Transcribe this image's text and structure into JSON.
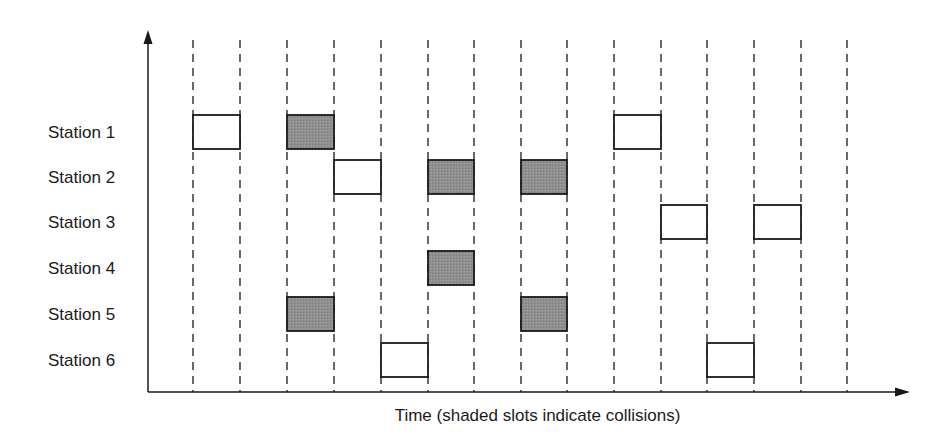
{
  "diagram": {
    "x_axis_caption": "Time (shaded slots indicate collisions)",
    "colors": {
      "line": "#1a1a1a",
      "dash": "#444444",
      "collision_fill": "#8f8f8f",
      "frame_fill": "#ffffff"
    },
    "slot_boundaries_x": [
      193,
      240,
      287,
      334,
      381,
      428,
      474,
      521,
      567,
      614,
      661,
      707,
      754,
      801,
      847
    ],
    "slot_count": 14,
    "stations": [
      {
        "label": "Station 1",
        "frames": [
          {
            "slot": 0,
            "collision": false
          },
          {
            "slot": 2,
            "collision": true
          },
          {
            "slot": 9,
            "collision": false
          }
        ]
      },
      {
        "label": "Station 2",
        "frames": [
          {
            "slot": 3,
            "collision": false
          },
          {
            "slot": 5,
            "collision": true
          },
          {
            "slot": 7,
            "collision": true
          }
        ]
      },
      {
        "label": "Station 3",
        "frames": [
          {
            "slot": 10,
            "collision": false
          },
          {
            "slot": 12,
            "collision": false
          }
        ]
      },
      {
        "label": "Station 4",
        "frames": [
          {
            "slot": 5,
            "collision": true
          }
        ]
      },
      {
        "label": "Station 5",
        "frames": [
          {
            "slot": 2,
            "collision": true
          },
          {
            "slot": 7,
            "collision": true
          }
        ]
      },
      {
        "label": "Station 6",
        "frames": [
          {
            "slot": 4,
            "collision": false
          },
          {
            "slot": 11,
            "collision": false
          }
        ]
      }
    ]
  }
}
